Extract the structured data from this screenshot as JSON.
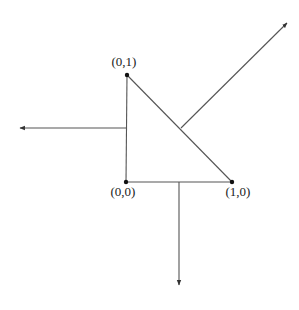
{
  "diagram": {
    "type": "triangle-with-outward-normals",
    "vertices": [
      {
        "id": "origin",
        "label": "(0,0)",
        "x": 126,
        "y": 182,
        "label_x": 123,
        "label_y": 196
      },
      {
        "id": "x-unit",
        "label": "(1,0)",
        "x": 232,
        "y": 182,
        "label_x": 238,
        "label_y": 196
      },
      {
        "id": "y-unit",
        "label": "(0,1)",
        "x": 127,
        "y": 75,
        "label_x": 124,
        "label_y": 66
      }
    ],
    "normals": [
      {
        "id": "left-normal",
        "direction": "left",
        "x1": 127,
        "y1": 128,
        "x2": 20,
        "y2": 128
      },
      {
        "id": "bottom-normal",
        "direction": "down",
        "x1": 179,
        "y1": 182,
        "x2": 179,
        "y2": 285
      },
      {
        "id": "diagonal-normal",
        "direction": "up-right",
        "x1": 181,
        "y1": 128,
        "x2": 287,
        "y2": 23
      }
    ],
    "colors": {
      "line": "#555555",
      "dot": "#111111",
      "text": "#222222"
    }
  }
}
